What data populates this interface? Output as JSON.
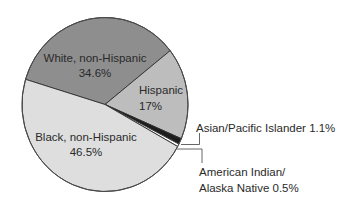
{
  "chart_data": {
    "type": "pie",
    "title": "",
    "start_angle_deg": 196.8,
    "slices": [
      {
        "label": "White, non-Hispanic",
        "value": 34.6,
        "value_label": "34.6%",
        "color": "#8e8e8e"
      },
      {
        "label": "Hispanic",
        "value": 17,
        "value_label": "17%",
        "color": "#bdbdbd"
      },
      {
        "label": "Asian/Pacific Islander",
        "value": 1.1,
        "value_label": "1.1%",
        "color": "#1c1c1c"
      },
      {
        "label": "American Indian/ Alaska Native",
        "value": 0.5,
        "value_label": "0.5%",
        "color": "#ffffff"
      },
      {
        "label": "Black, non-Hispanic",
        "value": 46.5,
        "value_label": "46.5%",
        "color": "#dedede"
      }
    ],
    "legend": "none (inline labels and leader lines)"
  },
  "labels": {
    "white": {
      "name": "White, non-Hispanic",
      "pct": "34.6%"
    },
    "hispanic": {
      "name": "Hispanic",
      "pct": "17%"
    },
    "black": {
      "name": "Black, non-Hispanic",
      "pct": "46.5%"
    },
    "asian": {
      "text": "Asian/Pacific Islander 1.1%"
    },
    "aian": {
      "line1": "American Indian/",
      "line2": "Alaska Native 0.5%"
    }
  }
}
